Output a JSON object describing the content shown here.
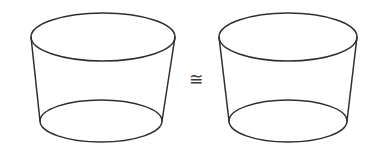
{
  "figure": {
    "background_color": "#ffffff",
    "stroke_color": "#2f2f2f",
    "stroke_width": 1.5,
    "width": 379,
    "height": 159
  },
  "relation": {
    "symbol": "≅",
    "name": "congruent-to",
    "reading": "is congruent to"
  },
  "shapes": [
    {
      "id": "left-solid",
      "label": "left frustum",
      "type": "frustum",
      "top_ellipse": {
        "cx": 103,
        "cy": 37,
        "rx": 72,
        "ry": 24
      },
      "bottom_ellipse": {
        "cx": 101,
        "cy": 121,
        "rx": 61,
        "ry": 21
      }
    },
    {
      "id": "right-solid",
      "label": "right frustum",
      "type": "frustum",
      "top_ellipse": {
        "cx": 288,
        "cy": 37,
        "rx": 69,
        "ry": 24
      },
      "bottom_ellipse": {
        "cx": 288,
        "cy": 121,
        "rx": 59,
        "ry": 21
      }
    }
  ]
}
